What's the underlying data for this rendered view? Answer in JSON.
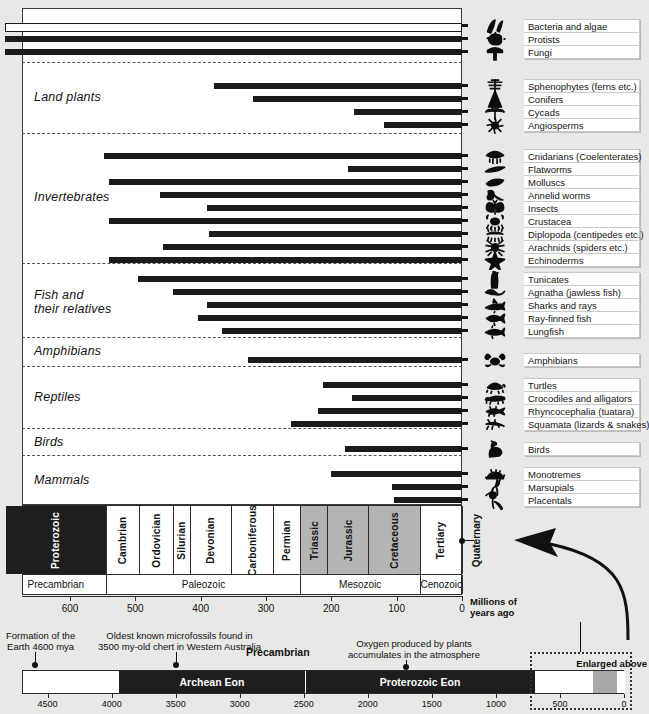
{
  "figure": {
    "axis": {
      "unit_label": "Millions of\nyears ago",
      "ticks": [
        {
          "value": 600,
          "label": "600"
        },
        {
          "value": 500,
          "label": "500"
        },
        {
          "value": 400,
          "label": "400"
        },
        {
          "value": 300,
          "label": "300"
        },
        {
          "value": 200,
          "label": "200"
        },
        {
          "value": 100,
          "label": "100"
        },
        {
          "value": 0,
          "label": "0"
        }
      ],
      "range_mya": [
        700,
        0
      ]
    },
    "groups": [
      {
        "label": "Land plants"
      },
      {
        "label": "Invertebrates"
      },
      {
        "label": "Fish and\ntheir relatives"
      },
      {
        "label": "Amphibians"
      },
      {
        "label": "Reptiles"
      },
      {
        "label": "Birds"
      },
      {
        "label": "Mammals"
      }
    ],
    "periods": [
      {
        "name": "Proterozoic",
        "start": 700,
        "end": 545,
        "shade": "dark"
      },
      {
        "name": "Cambrian",
        "start": 545,
        "end": 495,
        "shade": "white"
      },
      {
        "name": "Ordovician",
        "start": 495,
        "end": 443,
        "shade": "white"
      },
      {
        "name": "Silurian",
        "start": 443,
        "end": 417,
        "shade": "white"
      },
      {
        "name": "Devonian",
        "start": 417,
        "end": 354,
        "shade": "white"
      },
      {
        "name": "Carboniferous",
        "start": 354,
        "end": 290,
        "shade": "white"
      },
      {
        "name": "Permian",
        "start": 290,
        "end": 248,
        "shade": "white"
      },
      {
        "name": "Triassic",
        "start": 248,
        "end": 206,
        "shade": "gray"
      },
      {
        "name": "Jurassic",
        "start": 206,
        "end": 144,
        "shade": "gray"
      },
      {
        "name": "Cretaceous",
        "start": 144,
        "end": 65,
        "shade": "gray"
      },
      {
        "name": "Tertiary",
        "start": 65,
        "end": 2,
        "shade": "white"
      },
      {
        "name": "Quaternary",
        "start": 2,
        "end": 0,
        "shade": "white"
      }
    ],
    "eras": [
      {
        "name": "Precambrian",
        "start": 700,
        "end": 545
      },
      {
        "name": "Paleozoic",
        "start": 545,
        "end": 248
      },
      {
        "name": "Mesozoic",
        "start": 248,
        "end": 65
      },
      {
        "name": "Cenozoic",
        "start": 65,
        "end": 0
      }
    ],
    "quaternary_label": "Quaternary",
    "taxa": [
      {
        "name": "Bacteria and algae",
        "icon": "bacteria-icon",
        "start": 700,
        "end": 0,
        "style": "hollow"
      },
      {
        "name": "Protists",
        "icon": "protist-icon",
        "start": 700,
        "end": 0,
        "style": "solid"
      },
      {
        "name": "Fungi",
        "icon": "fungus-icon",
        "start": 700,
        "end": 0,
        "style": "solid"
      },
      {
        "name": "Sphenophytes (ferns etc.)",
        "icon": "horsetail-icon",
        "start": 380,
        "end": 0,
        "style": "solid"
      },
      {
        "name": "Conifers",
        "icon": "conifer-icon",
        "start": 320,
        "end": 0,
        "style": "solid"
      },
      {
        "name": "Cycads",
        "icon": "cycad-icon",
        "start": 165,
        "end": 0,
        "style": "solid"
      },
      {
        "name": "Angiosperms",
        "icon": "flower-icon",
        "start": 120,
        "end": 0,
        "style": "solid"
      },
      {
        "name": "Cnidarians (Coelenterates)",
        "icon": "jellyfish-icon",
        "start": 548,
        "end": 0,
        "style": "solid"
      },
      {
        "name": "Flatworms",
        "icon": "flatworm-icon",
        "start": 175,
        "end": 0,
        "style": "solid"
      },
      {
        "name": "Molluscs",
        "icon": "mollusc-icon",
        "start": 540,
        "end": 0,
        "style": "solid"
      },
      {
        "name": "Annelid worms",
        "icon": "annelid-icon",
        "start": 462,
        "end": 0,
        "style": "solid"
      },
      {
        "name": "Insects",
        "icon": "butterfly-icon",
        "start": 390,
        "end": 0,
        "style": "solid"
      },
      {
        "name": "Crustacea",
        "icon": "crab-icon",
        "start": 540,
        "end": 0,
        "style": "solid"
      },
      {
        "name": "Diplopoda (centipedes etc.)",
        "icon": "centipede-icon",
        "start": 388,
        "end": 0,
        "style": "solid"
      },
      {
        "name": "Arachnids (spiders etc.)",
        "icon": "spider-icon",
        "start": 458,
        "end": 0,
        "style": "solid"
      },
      {
        "name": "Echinoderms",
        "icon": "starfish-icon",
        "start": 540,
        "end": 0,
        "style": "solid"
      },
      {
        "name": "Tunicates",
        "icon": "tunicate-icon",
        "start": 496,
        "end": 0,
        "style": "solid"
      },
      {
        "name": "Agnatha (jawless fish)",
        "icon": "lamprey-icon",
        "start": 442,
        "end": 0,
        "style": "solid"
      },
      {
        "name": "Sharks and rays",
        "icon": "shark-icon",
        "start": 390,
        "end": 0,
        "style": "solid"
      },
      {
        "name": "Ray-finned fish",
        "icon": "rayfin-icon",
        "start": 404,
        "end": 0,
        "style": "solid"
      },
      {
        "name": "Lungfish",
        "icon": "lungfish-icon",
        "start": 368,
        "end": 0,
        "style": "solid"
      },
      {
        "name": "Amphibians",
        "icon": "frog-icon",
        "start": 328,
        "end": 0,
        "style": "solid"
      },
      {
        "name": "Turtles",
        "icon": "turtle-icon",
        "start": 213,
        "end": 0,
        "style": "solid"
      },
      {
        "name": "Crocodiles and alligators",
        "icon": "crocodile-icon",
        "start": 168,
        "end": 0,
        "style": "solid"
      },
      {
        "name": "Rhyncocephalia (tuatara)",
        "icon": "tuatara-icon",
        "start": 220,
        "end": 0,
        "style": "solid"
      },
      {
        "name": "Squamata (lizards & snakes)",
        "icon": "lizard-icon",
        "start": 262,
        "end": 0,
        "style": "solid"
      },
      {
        "name": "Birds",
        "icon": "bird-icon",
        "start": 179,
        "end": 0,
        "style": "solid"
      },
      {
        "name": "Monotremes",
        "icon": "echidna-icon",
        "start": 200,
        "end": 0,
        "style": "solid"
      },
      {
        "name": "Marsupials",
        "icon": "kangaroo-icon",
        "start": 107,
        "end": 0,
        "style": "solid"
      },
      {
        "name": "Placentals",
        "icon": "monkey-icon",
        "start": 104,
        "end": 0,
        "style": "solid"
      }
    ]
  },
  "eon_timeline": {
    "range_mya": [
      4700,
      0
    ],
    "segments": [
      {
        "name": "",
        "start": 4700,
        "end": 3950,
        "shade": "white"
      },
      {
        "name": "Archean Eon",
        "start": 3950,
        "end": 2500,
        "shade": "dark"
      },
      {
        "name": "Proterozoic Eon",
        "start": 2500,
        "end": 700,
        "shade": "dark"
      },
      {
        "name": "",
        "start": 700,
        "end": 250,
        "shade": "white"
      },
      {
        "name": "",
        "start": 250,
        "end": 65,
        "shade": "gray"
      },
      {
        "name": "",
        "start": 65,
        "end": 0,
        "shade": "white"
      }
    ],
    "ticks": [
      {
        "value": 4500,
        "label": "4500"
      },
      {
        "value": 4000,
        "label": "4000"
      },
      {
        "value": 3500,
        "label": "3500"
      },
      {
        "value": 3000,
        "label": "3000"
      },
      {
        "value": 2500,
        "label": "2500"
      },
      {
        "value": 2000,
        "label": "2000"
      },
      {
        "value": 1500,
        "label": "1500"
      },
      {
        "value": 1000,
        "label": "1000"
      },
      {
        "value": 500,
        "label": "500"
      },
      {
        "value": 0,
        "label": "0"
      }
    ],
    "annotations": [
      {
        "text": "Formation of the\nEarth 4600 mya",
        "at_mya": 4600
      },
      {
        "text": "Oldest known microfossils found in\n3500 my-old chert in Western Australia",
        "at_mya": 3500
      },
      {
        "text": "Oxygen produced by plants\naccumulates in the atmosphere",
        "at_mya": 1700
      }
    ],
    "precambrian_label": "Precambrian",
    "enlarged_label": "Enlarged above"
  },
  "colors": {
    "bar": "#1b1b1b",
    "dark_band": "#1e1e1e",
    "gray_band": "#b4b4b4",
    "background": "#e8e8e6",
    "chart_bg": "#ffffff"
  },
  "chart_data": {
    "type": "bar",
    "xlabel": "Millions of years ago",
    "ylabel": "",
    "xlim": [
      700,
      0
    ],
    "grid": false,
    "legend": "none",
    "orientation": "horizontal",
    "categories": [
      "Bacteria and algae",
      "Protists",
      "Fungi",
      "Sphenophytes (ferns etc.)",
      "Conifers",
      "Cycads",
      "Angiosperms",
      "Cnidarians (Coelenterates)",
      "Flatworms",
      "Molluscs",
      "Annelid worms",
      "Insects",
      "Crustacea",
      "Diplopoda (centipedes etc.)",
      "Arachnids (spiders etc.)",
      "Echinoderms",
      "Tunicates",
      "Agnatha (jawless fish)",
      "Sharks and rays",
      "Ray-finned fish",
      "Lungfish",
      "Amphibians",
      "Turtles",
      "Crocodiles and alligators",
      "Rhyncocephalia (tuatara)",
      "Squamata (lizards & snakes)",
      "Birds",
      "Monotremes",
      "Marsupials",
      "Placentals"
    ],
    "ranges_mya": [
      [
        700,
        0
      ],
      [
        700,
        0
      ],
      [
        700,
        0
      ],
      [
        380,
        0
      ],
      [
        320,
        0
      ],
      [
        165,
        0
      ],
      [
        120,
        0
      ],
      [
        548,
        0
      ],
      [
        175,
        0
      ],
      [
        540,
        0
      ],
      [
        462,
        0
      ],
      [
        390,
        0
      ],
      [
        540,
        0
      ],
      [
        388,
        0
      ],
      [
        458,
        0
      ],
      [
        540,
        0
      ],
      [
        496,
        0
      ],
      [
        442,
        0
      ],
      [
        390,
        0
      ],
      [
        404,
        0
      ],
      [
        368,
        0
      ],
      [
        328,
        0
      ],
      [
        213,
        0
      ],
      [
        168,
        0
      ],
      [
        220,
        0
      ],
      [
        262,
        0
      ],
      [
        179,
        0
      ],
      [
        200,
        0
      ],
      [
        107,
        0
      ],
      [
        104,
        0
      ]
    ],
    "group_labels": [
      "Land plants",
      "Invertebrates",
      "Fish and their relatives",
      "Amphibians",
      "Reptiles",
      "Birds",
      "Mammals"
    ],
    "tick_labels": [
      "600",
      "500",
      "400",
      "300",
      "200",
      "100",
      "0"
    ]
  }
}
